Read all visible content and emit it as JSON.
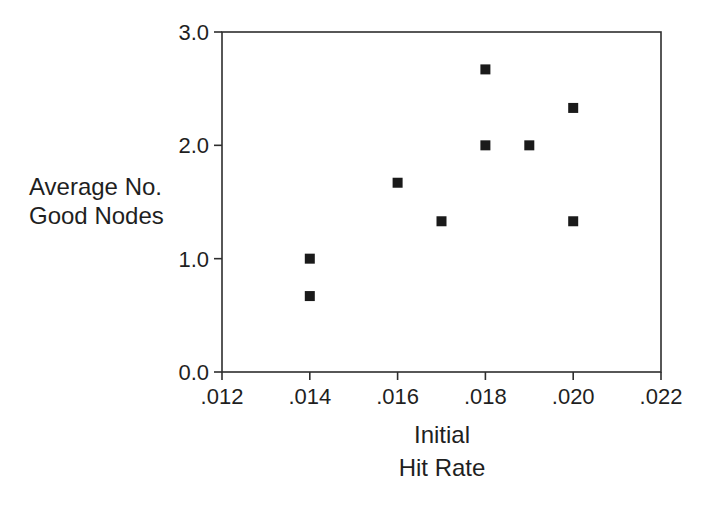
{
  "figure": {
    "background": "#ffffff",
    "ink_color": "#1f1f1f"
  },
  "chart_data": {
    "type": "scatter",
    "title": "",
    "xlabel": "Initial Hit Rate",
    "xlabel_lines": [
      "Initial",
      "Hit Rate"
    ],
    "ylabel": "Average No. Good Nodes",
    "ylabel_lines": [
      "Average No.",
      "Good Nodes"
    ],
    "points": [
      {
        "x": 0.014,
        "y": 1.0
      },
      {
        "x": 0.014,
        "y": 0.67
      },
      {
        "x": 0.016,
        "y": 1.67
      },
      {
        "x": 0.017,
        "y": 1.33
      },
      {
        "x": 0.018,
        "y": 2.67
      },
      {
        "x": 0.018,
        "y": 2.0
      },
      {
        "x": 0.019,
        "y": 2.0
      },
      {
        "x": 0.02,
        "y": 2.33
      },
      {
        "x": 0.02,
        "y": 1.33
      }
    ],
    "xlim": [
      0.012,
      0.022
    ],
    "ylim": [
      0.0,
      3.0
    ],
    "x_tick_values": [
      0.012,
      0.014,
      0.016,
      0.018,
      0.02,
      0.022
    ],
    "x_tick_labels": [
      ".012",
      ".014",
      ".016",
      ".018",
      ".020",
      ".022"
    ],
    "y_tick_values": [
      0.0,
      1.0,
      2.0,
      3.0
    ],
    "y_tick_labels": [
      "0.0",
      "1.0",
      "2.0",
      "3.0"
    ],
    "marker": "filled-square",
    "marker_color": "#1a1a1a",
    "axis_color": "#2e2e2e",
    "tick_label_color": "#1f1f1f",
    "grid": false,
    "legend": null
  }
}
